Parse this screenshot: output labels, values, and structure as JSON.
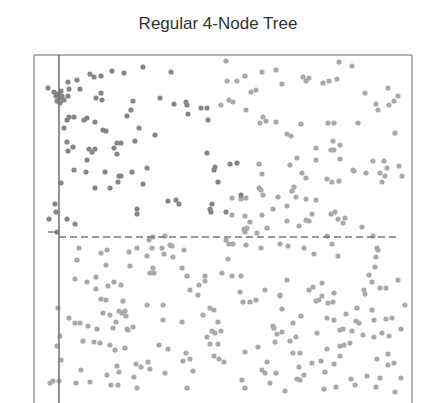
{
  "chart_data": {
    "type": "scatter",
    "title": "Regular 4-Node Tree",
    "xlabel": "",
    "ylabel": "",
    "grid": false,
    "legend": null,
    "frame": {
      "left": 34,
      "top": 55,
      "right": 412,
      "bottom": 403
    },
    "vertical_line": {
      "x": 59,
      "style": "solid"
    },
    "horizontal_line": {
      "y": 237,
      "x_start": 59,
      "x_end": 400,
      "style": "dashed"
    },
    "y_tick": {
      "y": 232,
      "x_start": 48,
      "x_end": 59
    },
    "colors": {
      "dark": "#858585",
      "light": "#a9a9a9",
      "frame": "#777777"
    },
    "point_radius": 2.6,
    "points_dark": [
      [
        48,
        88
      ],
      [
        54,
        92
      ],
      [
        56,
        96
      ],
      [
        58,
        94
      ],
      [
        60,
        98
      ],
      [
        61,
        91
      ],
      [
        62,
        96
      ],
      [
        64,
        100
      ],
      [
        57,
        101
      ],
      [
        60,
        103
      ],
      [
        68,
        82
      ],
      [
        69,
        89
      ],
      [
        77,
        80
      ],
      [
        68,
        96
      ],
      [
        80,
        89
      ],
      [
        90,
        74
      ],
      [
        94,
        77
      ],
      [
        101,
        76
      ],
      [
        112,
        71
      ],
      [
        124,
        73
      ],
      [
        143,
        67
      ],
      [
        171,
        72
      ],
      [
        102,
        100
      ],
      [
        96,
        98
      ],
      [
        101,
        93
      ],
      [
        133,
        101
      ],
      [
        160,
        98
      ],
      [
        174,
        104
      ],
      [
        186,
        102
      ],
      [
        201,
        108
      ],
      [
        207,
        108
      ],
      [
        208,
        120
      ],
      [
        69,
        117
      ],
      [
        67,
        120
      ],
      [
        67,
        142
      ],
      [
        74,
        117
      ],
      [
        84,
        120
      ],
      [
        87,
        118
      ],
      [
        95,
        122
      ],
      [
        117,
        143
      ],
      [
        135,
        141
      ],
      [
        103,
        130
      ],
      [
        155,
        135
      ],
      [
        139,
        128
      ],
      [
        64,
        128
      ],
      [
        106,
        131
      ],
      [
        187,
        105
      ],
      [
        188,
        114
      ],
      [
        131,
        110
      ],
      [
        127,
        116
      ],
      [
        121,
        143
      ],
      [
        68,
        151
      ],
      [
        73,
        147
      ],
      [
        89,
        149
      ],
      [
        92,
        152
      ],
      [
        74,
        170
      ],
      [
        86,
        172
      ],
      [
        95,
        188
      ],
      [
        110,
        188
      ],
      [
        105,
        172
      ],
      [
        61,
        183
      ],
      [
        55,
        204
      ],
      [
        56,
        212
      ],
      [
        67,
        219
      ],
      [
        49,
        219
      ],
      [
        75,
        224
      ],
      [
        95,
        149
      ],
      [
        114,
        148
      ],
      [
        117,
        154
      ],
      [
        87,
        160
      ],
      [
        119,
        176
      ],
      [
        121,
        176
      ],
      [
        118,
        182
      ],
      [
        132,
        172
      ],
      [
        143,
        184
      ],
      [
        147,
        168
      ],
      [
        137,
        209
      ],
      [
        137,
        214
      ],
      [
        168,
        201
      ],
      [
        176,
        200
      ],
      [
        179,
        204
      ],
      [
        207,
        153
      ],
      [
        214,
        170
      ],
      [
        215,
        167
      ],
      [
        218,
        182
      ],
      [
        230,
        164
      ],
      [
        237,
        163
      ],
      [
        241,
        195
      ],
      [
        210,
        209
      ],
      [
        211,
        212
      ],
      [
        212,
        204
      ],
      [
        226,
        212
      ],
      [
        57,
        232
      ]
    ],
    "points_light": [
      [
        77,
        260
      ],
      [
        79,
        248
      ],
      [
        87,
        282
      ],
      [
        96,
        277
      ],
      [
        101,
        299
      ],
      [
        106,
        300
      ],
      [
        101,
        253
      ],
      [
        107,
        250
      ],
      [
        96,
        289
      ],
      [
        108,
        286
      ],
      [
        114,
        282
      ],
      [
        106,
        265
      ],
      [
        130,
        266
      ],
      [
        129,
        252
      ],
      [
        137,
        248
      ],
      [
        147,
        256
      ],
      [
        152,
        248
      ],
      [
        153,
        237
      ],
      [
        162,
        248
      ],
      [
        164,
        254
      ],
      [
        149,
        240
      ],
      [
        165,
        236
      ],
      [
        170,
        245
      ],
      [
        172,
        246
      ],
      [
        153,
        268
      ],
      [
        154,
        273
      ],
      [
        150,
        273
      ],
      [
        173,
        257
      ],
      [
        182,
        268
      ],
      [
        184,
        250
      ],
      [
        187,
        276
      ],
      [
        190,
        290
      ],
      [
        199,
        285
      ],
      [
        205,
        281
      ],
      [
        198,
        295
      ],
      [
        228,
        259
      ],
      [
        222,
        273
      ],
      [
        205,
        276
      ],
      [
        210,
        308
      ],
      [
        214,
        310
      ],
      [
        123,
        301
      ],
      [
        119,
        311
      ],
      [
        103,
        313
      ],
      [
        110,
        315
      ],
      [
        122,
        313
      ],
      [
        116,
        322
      ],
      [
        113,
        328
      ],
      [
        125,
        311
      ],
      [
        126,
        316
      ],
      [
        127,
        329
      ],
      [
        69,
        318
      ],
      [
        75,
        323
      ],
      [
        80,
        323
      ],
      [
        58,
        308
      ],
      [
        60,
        336
      ],
      [
        88,
        326
      ],
      [
        83,
        341
      ],
      [
        94,
        342
      ],
      [
        97,
        329
      ],
      [
        100,
        343
      ],
      [
        110,
        345
      ],
      [
        115,
        350
      ],
      [
        125,
        348
      ],
      [
        117,
        366
      ],
      [
        119,
        372
      ],
      [
        136,
        364
      ],
      [
        141,
        367
      ],
      [
        159,
        345
      ],
      [
        168,
        349
      ],
      [
        163,
        320
      ],
      [
        183,
        361
      ],
      [
        210,
        344
      ],
      [
        214,
        356
      ],
      [
        182,
        322
      ],
      [
        133,
        327
      ],
      [
        128,
        330
      ],
      [
        75,
        279
      ],
      [
        121,
        285
      ],
      [
        147,
        305
      ],
      [
        163,
        305
      ],
      [
        203,
        315
      ],
      [
        212,
        331
      ],
      [
        218,
        322
      ],
      [
        221,
        331
      ],
      [
        218,
        344
      ],
      [
        207,
        337
      ],
      [
        215,
        333
      ],
      [
        219,
        359
      ],
      [
        224,
        362
      ],
      [
        190,
        359
      ],
      [
        53,
        381
      ],
      [
        50,
        383
      ],
      [
        59,
        381
      ],
      [
        76,
        383
      ],
      [
        90,
        382
      ],
      [
        111,
        385
      ],
      [
        134,
        377
      ],
      [
        137,
        388
      ],
      [
        165,
        373
      ],
      [
        193,
        371
      ],
      [
        186,
        353
      ],
      [
        57,
        346
      ],
      [
        61,
        360
      ],
      [
        81,
        370
      ],
      [
        107,
        375
      ],
      [
        118,
        385
      ],
      [
        150,
        369
      ],
      [
        187,
        388
      ],
      [
        148,
        362
      ],
      [
        226,
        240
      ],
      [
        229,
        244
      ],
      [
        233,
        244
      ],
      [
        246,
        245
      ],
      [
        261,
        248
      ],
      [
        280,
        244
      ],
      [
        288,
        246
      ],
      [
        304,
        248
      ],
      [
        314,
        254
      ],
      [
        327,
        236
      ],
      [
        332,
        244
      ],
      [
        338,
        256
      ],
      [
        377,
        248
      ],
      [
        378,
        250
      ],
      [
        376,
        257
      ],
      [
        375,
        267
      ],
      [
        369,
        275
      ],
      [
        372,
        282
      ],
      [
        364,
        290
      ],
      [
        386,
        288
      ],
      [
        398,
        280
      ],
      [
        322,
        283
      ],
      [
        232,
        276
      ],
      [
        241,
        276
      ],
      [
        243,
        302
      ],
      [
        250,
        302
      ],
      [
        240,
        292
      ],
      [
        256,
        300
      ],
      [
        265,
        290
      ],
      [
        280,
        296
      ],
      [
        287,
        280
      ],
      [
        309,
        290
      ],
      [
        319,
        300
      ],
      [
        328,
        303
      ],
      [
        333,
        302
      ],
      [
        334,
        293
      ],
      [
        322,
        296
      ],
      [
        313,
        287
      ],
      [
        365,
        294
      ],
      [
        380,
        288
      ],
      [
        372,
        310
      ],
      [
        357,
        308
      ],
      [
        346,
        314
      ],
      [
        374,
        320
      ],
      [
        356,
        321
      ],
      [
        359,
        323
      ],
      [
        386,
        319
      ],
      [
        389,
        336
      ],
      [
        388,
        354
      ],
      [
        273,
        326
      ],
      [
        277,
        334
      ],
      [
        274,
        328
      ],
      [
        275,
        342
      ],
      [
        282,
        332
      ],
      [
        296,
        337
      ],
      [
        293,
        323
      ],
      [
        282,
        309
      ],
      [
        280,
        295
      ],
      [
        290,
        341
      ],
      [
        293,
        353
      ],
      [
        300,
        353
      ],
      [
        301,
        316
      ],
      [
        299,
        367
      ],
      [
        304,
        375
      ],
      [
        327,
        349
      ],
      [
        312,
        363
      ],
      [
        317,
        333
      ],
      [
        327,
        318
      ],
      [
        334,
        320
      ],
      [
        334,
        364
      ],
      [
        340,
        346
      ],
      [
        344,
        345
      ],
      [
        350,
        343
      ],
      [
        340,
        356
      ],
      [
        363,
        335
      ],
      [
        377,
        359
      ],
      [
        388,
        365
      ],
      [
        401,
        329
      ],
      [
        405,
        305
      ],
      [
        352,
        331
      ],
      [
        316,
        301
      ],
      [
        340,
        330
      ],
      [
        343,
        329
      ],
      [
        374,
        337
      ],
      [
        382,
        333
      ],
      [
        392,
        318
      ],
      [
        394,
        363
      ],
      [
        367,
        376
      ],
      [
        376,
        387
      ],
      [
        351,
        379
      ],
      [
        355,
        385
      ],
      [
        336,
        387
      ],
      [
        325,
        372
      ],
      [
        324,
        389
      ],
      [
        262,
        370
      ],
      [
        265,
        373
      ],
      [
        297,
        379
      ],
      [
        300,
        380
      ],
      [
        285,
        391
      ],
      [
        245,
        352
      ],
      [
        258,
        347
      ],
      [
        267,
        362
      ],
      [
        242,
        380
      ],
      [
        245,
        388
      ],
      [
        270,
        383
      ],
      [
        276,
        373
      ],
      [
        321,
        361
      ],
      [
        380,
        378
      ],
      [
        395,
        392
      ],
      [
        401,
        378
      ],
      [
        226,
        61
      ],
      [
        227,
        81
      ],
      [
        237,
        81
      ],
      [
        245,
        76
      ],
      [
        251,
        92
      ],
      [
        256,
        90
      ],
      [
        262,
        72
      ],
      [
        276,
        70
      ],
      [
        282,
        84
      ],
      [
        303,
        77
      ],
      [
        306,
        81
      ],
      [
        309,
        78
      ],
      [
        323,
        83
      ],
      [
        329,
        81
      ],
      [
        337,
        79
      ],
      [
        339,
        62
      ],
      [
        352,
        66
      ],
      [
        365,
        93
      ],
      [
        378,
        110
      ],
      [
        388,
        88
      ],
      [
        389,
        105
      ],
      [
        394,
        101
      ],
      [
        221,
        105
      ],
      [
        229,
        100
      ],
      [
        233,
        102
      ],
      [
        246,
        110
      ],
      [
        263,
        117
      ],
      [
        260,
        123
      ],
      [
        266,
        121
      ],
      [
        276,
        122
      ],
      [
        301,
        124
      ],
      [
        328,
        123
      ],
      [
        334,
        123
      ],
      [
        358,
        123
      ],
      [
        376,
        104
      ],
      [
        395,
        133
      ],
      [
        398,
        96
      ],
      [
        334,
        150
      ],
      [
        340,
        145
      ],
      [
        331,
        150
      ],
      [
        340,
        159
      ],
      [
        327,
        179
      ],
      [
        332,
        182
      ],
      [
        339,
        181
      ],
      [
        353,
        170
      ],
      [
        354,
        171
      ],
      [
        366,
        173
      ],
      [
        380,
        173
      ],
      [
        384,
        161
      ],
      [
        259,
        164
      ],
      [
        262,
        174
      ],
      [
        290,
        165
      ],
      [
        297,
        158
      ],
      [
        302,
        173
      ],
      [
        306,
        178
      ],
      [
        316,
        148
      ],
      [
        287,
        134
      ],
      [
        291,
        136
      ],
      [
        316,
        160
      ],
      [
        333,
        141
      ],
      [
        232,
        198
      ],
      [
        241,
        199
      ],
      [
        246,
        198
      ],
      [
        259,
        188
      ],
      [
        261,
        190
      ],
      [
        263,
        195
      ],
      [
        278,
        197
      ],
      [
        292,
        191
      ],
      [
        294,
        187
      ],
      [
        296,
        197
      ],
      [
        306,
        199
      ],
      [
        316,
        200
      ],
      [
        335,
        212
      ],
      [
        338,
        219
      ],
      [
        343,
        223
      ],
      [
        331,
        214
      ],
      [
        382,
        182
      ],
      [
        385,
        176
      ],
      [
        387,
        168
      ],
      [
        399,
        166
      ],
      [
        402,
        176
      ],
      [
        373,
        161
      ],
      [
        232,
        215
      ],
      [
        245,
        216
      ],
      [
        257,
        233
      ],
      [
        262,
        215
      ],
      [
        267,
        228
      ],
      [
        273,
        209
      ],
      [
        287,
        206
      ],
      [
        287,
        221
      ],
      [
        247,
        228
      ],
      [
        250,
        222
      ],
      [
        299,
        226
      ],
      [
        309,
        221
      ],
      [
        306,
        220
      ],
      [
        312,
        214
      ],
      [
        345,
        218
      ],
      [
        362,
        227
      ],
      [
        373,
        236
      ],
      [
        245,
        232
      ],
      [
        244,
        229
      ]
    ]
  }
}
